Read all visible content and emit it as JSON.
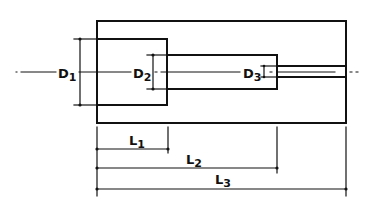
{
  "diagram": {
    "type": "technical-drawing",
    "colors": {
      "line": "#111111",
      "background": "#ffffff"
    },
    "diameter_labels": [
      {
        "id": "D1",
        "letter": "D",
        "sub": "1"
      },
      {
        "id": "D2",
        "letter": "D",
        "sub": "2"
      },
      {
        "id": "D3",
        "letter": "D",
        "sub": "3"
      }
    ],
    "length_labels": [
      {
        "id": "L1",
        "letter": "L",
        "sub": "1"
      },
      {
        "id": "L2",
        "letter": "L",
        "sub": "2"
      },
      {
        "id": "L3",
        "letter": "L",
        "sub": "3"
      }
    ]
  }
}
